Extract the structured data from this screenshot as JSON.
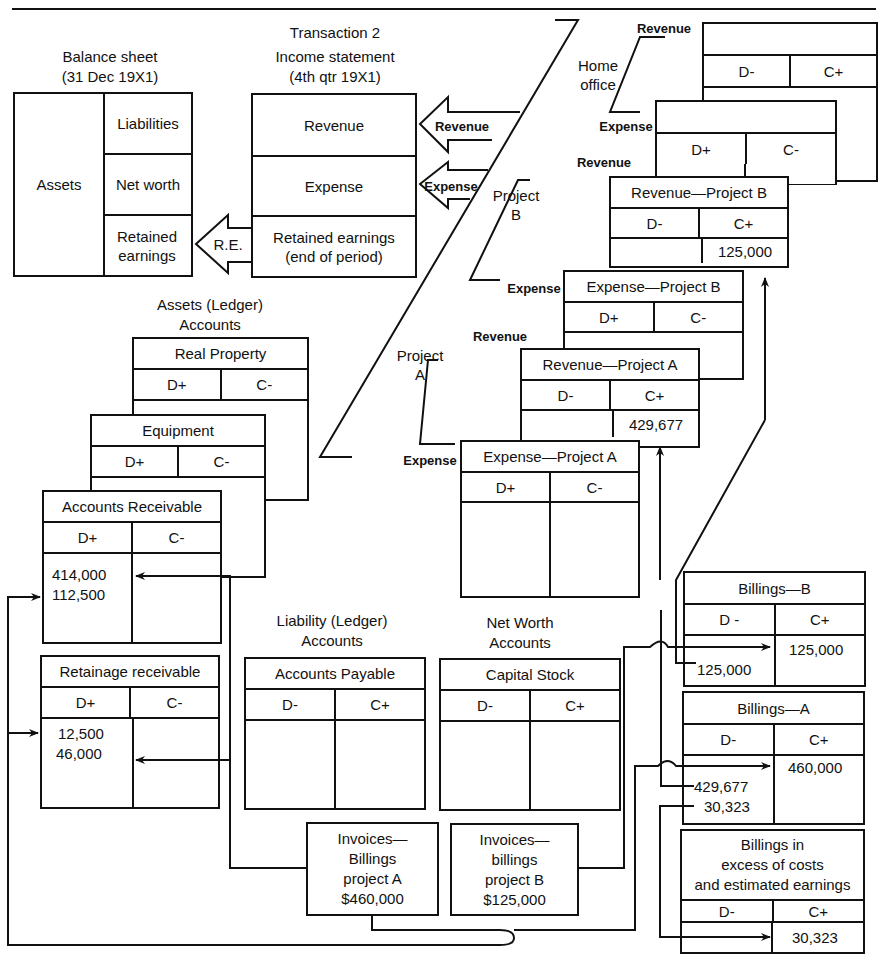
{
  "header": {
    "transaction": "Transaction 2"
  },
  "balance_sheet": {
    "title": "Balance sheet",
    "date": "(31 Dec 19X1)",
    "assets": "Assets",
    "liabilities": "Liabilities",
    "net_worth": "Net worth",
    "retained_earnings": "Retained earnings"
  },
  "income_statement": {
    "title": "Income statement",
    "period": "(4th qtr 19X1)",
    "revenue": "Revenue",
    "expense": "Expense",
    "retained_earnings": "Retained earnings (end of period)"
  },
  "arrows": {
    "revenue": "Revenue",
    "expense": "Expense",
    "re": "R.E."
  },
  "divisions": {
    "home_office": "Home office",
    "project_b": "Project B",
    "project_a": "Project A",
    "revenue": "Revenue",
    "expense": "Expense"
  },
  "home_office_accounts": {
    "revenue": {
      "title": "",
      "debit": "D-",
      "credit": "C+"
    },
    "expense": {
      "title": "",
      "debit": "D+",
      "credit": "C-"
    }
  },
  "project_accounts": {
    "revenue_b": {
      "title": "Revenue—Project B",
      "debit": "D-",
      "credit": "C+",
      "credit_values": "125,000"
    },
    "expense_b": {
      "title": "Expense—Project B",
      "debit": "D+",
      "credit": "C-"
    },
    "revenue_a": {
      "title": "Revenue—Project A",
      "debit": "D-",
      "credit": "C+",
      "credit_values": "429,677"
    },
    "expense_a": {
      "title": "Expense—Project A",
      "debit": "D+",
      "credit": "C-"
    }
  },
  "asset_ledger": {
    "heading": "Assets (Ledger)",
    "heading2": "Accounts",
    "real_property": {
      "title": "Real Property",
      "debit": "D+",
      "credit": "C-"
    },
    "equipment": {
      "title": "Equipment",
      "debit": "D+",
      "credit": "C-"
    },
    "accounts_receivable": {
      "title": "Accounts Receivable",
      "debit": "D+",
      "credit": "C-",
      "debit_values": [
        "414,000",
        "112,500"
      ]
    },
    "retainage_receivable": {
      "title": "Retainage receivable",
      "debit": "D+",
      "credit": "C-",
      "debit_values": [
        "12,500",
        "46,000"
      ]
    }
  },
  "liability_ledger": {
    "heading": "Liability (Ledger)",
    "heading2": "Accounts",
    "accounts_payable": {
      "title": "Accounts Payable",
      "debit": "D-",
      "credit": "C+"
    }
  },
  "net_worth_ledger": {
    "heading": "Net Worth",
    "heading2": "Accounts",
    "capital_stock": {
      "title": "Capital Stock",
      "debit": "D-",
      "credit": "C+"
    }
  },
  "invoices": {
    "a": {
      "line1": "Invoices—",
      "line2": "Billings",
      "line3": "project A",
      "amount": "$460,000"
    },
    "b": {
      "line1": "Invoices—",
      "line2": "billings",
      "line3": "project B",
      "amount": "$125,000"
    }
  },
  "billings": {
    "b": {
      "title": "Billings—B",
      "debit": "D -",
      "credit": "C+",
      "credit_value": "125,000",
      "debit_value": "125,000"
    },
    "a": {
      "title": "Billings—A",
      "debit": "D-",
      "credit": "C+",
      "credit_value": "460,000",
      "debit_values": [
        "429,677",
        "30,323"
      ]
    },
    "excess": {
      "line1": "Billings in",
      "line2": "excess of costs",
      "line3": "and estimated earnings",
      "debit": "D-",
      "credit": "C+",
      "credit_value": "30,323"
    }
  }
}
